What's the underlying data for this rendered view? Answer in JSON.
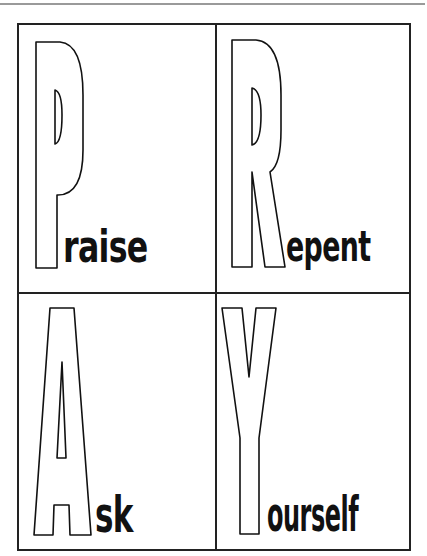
{
  "poster": {
    "acronym": "PRAY",
    "quadrants": [
      {
        "initial": "P",
        "rest": "raise",
        "full": "Praise"
      },
      {
        "initial": "R",
        "rest": "epent",
        "full": "Repent"
      },
      {
        "initial": "A",
        "rest": "sk",
        "full": "Ask"
      },
      {
        "initial": "Y",
        "rest": "ourself",
        "full": "Yourself"
      }
    ]
  },
  "colors": {
    "ink": "#111111",
    "border": "#222222",
    "background": "#ffffff",
    "top_rule": "#9a9a9a"
  }
}
